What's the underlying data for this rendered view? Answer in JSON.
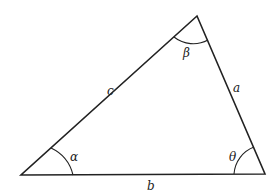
{
  "diagram": {
    "type": "triangle",
    "vertices": {
      "top": [
        197,
        16
      ],
      "bottom_left": [
        21,
        175
      ],
      "bottom_right": [
        265,
        174
      ]
    },
    "sides": [
      {
        "name": "c",
        "label": "c",
        "pos": [
          107,
          95
        ]
      },
      {
        "name": "a",
        "label": "a",
        "pos": [
          233,
          92
        ]
      },
      {
        "name": "b",
        "label": "b",
        "pos": [
          147,
          190
        ]
      }
    ],
    "angles": [
      {
        "name": "alpha",
        "label": "α",
        "pos": [
          70,
          161
        ]
      },
      {
        "name": "beta",
        "label": "β",
        "pos": [
          183,
          57
        ]
      },
      {
        "name": "theta",
        "label": "θ",
        "pos": [
          229,
          161
        ]
      }
    ],
    "stroke_color": "#222222"
  }
}
